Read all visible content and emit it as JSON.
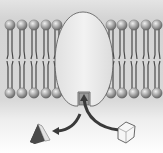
{
  "diagram": {
    "title": "",
    "colors": {
      "background_top": "#d8d8d8",
      "background_bottom": "#ffffff",
      "lipid_head": "#8e8e8e",
      "lipid_head_highlight": "#e6e6e6",
      "lipid_tail": "#4a4a4a",
      "protein_fill": "#ececec",
      "protein_stroke": "#555555",
      "arrow": "#3a3a3a",
      "substrate_fill": "#f4f4f4",
      "product_dark": "#3c3c3c",
      "product_light": "#cfcfcf"
    },
    "membrane": {
      "left_lipids_x": [
        10,
        22,
        34,
        46,
        57
      ],
      "right_lipids_x": [
        111,
        122,
        134,
        146,
        157
      ],
      "top_head_y": 25,
      "bottom_head_y": 93
    },
    "elements": [
      {
        "name": "membrane-bilayer",
        "label": ""
      },
      {
        "name": "membrane-protein",
        "label": ""
      },
      {
        "name": "active-site",
        "label": ""
      },
      {
        "name": "substrate-cube",
        "label": ""
      },
      {
        "name": "product-prism",
        "label": ""
      }
    ]
  }
}
